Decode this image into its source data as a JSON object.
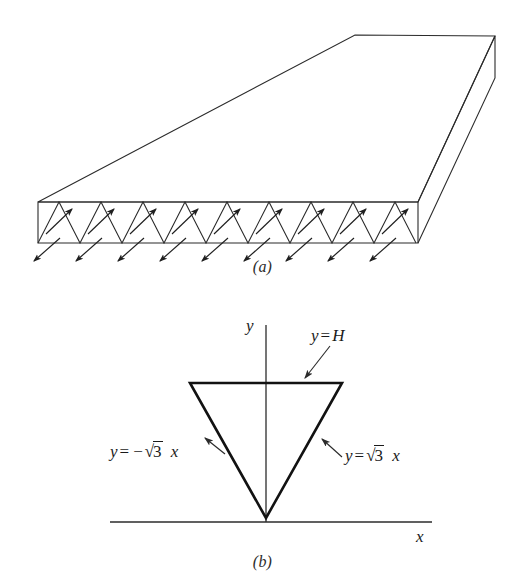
{
  "figure": {
    "panels": [
      {
        "id": "a",
        "caption": "(a)",
        "name": "three-dimensional-slab",
        "description": "prismatic slab with zigzag cross-hatched front face and flux arrows",
        "zigzag_peaks": 9,
        "inner_arrow_count": 9,
        "outer_arrow_count": 9,
        "inner_arrow_direction": "up-right",
        "outer_arrow_direction": "down-left"
      },
      {
        "id": "b",
        "caption": "(b)",
        "name": "cross-section-triangle",
        "description": "inverted equilateral triangle cross-section on x-y axes"
      }
    ]
  },
  "axes": {
    "y_label": "y",
    "x_label": "x"
  },
  "labels": {
    "top_edge": {
      "full": "y = H",
      "lhs": "y",
      "operator": "=",
      "rhs": "H"
    },
    "left_edge": {
      "full": "y = -√3 x",
      "lhs": "y",
      "operator": "=",
      "sign": "−",
      "radical": "√",
      "radicand": "3",
      "variable": "x"
    },
    "right_edge": {
      "full": "y = √3 x",
      "lhs": "y",
      "operator": "=",
      "radical": "√",
      "radicand": "3",
      "variable": "x"
    }
  },
  "colors": {
    "background": "#ffffff",
    "stroke": "#2b2b2b",
    "triangle_stroke": "#1a1a1a",
    "text": "#1a1a1a"
  },
  "geometry": {
    "triangle": {
      "apex": [
        266,
        226
      ],
      "top_left": [
        190,
        91
      ],
      "top_right": [
        342,
        91
      ]
    },
    "x_axis": {
      "y": 230,
      "x_start": 110,
      "x_end": 432
    },
    "y_axis": {
      "x": 266,
      "y_start": 33,
      "y_end": 230
    }
  }
}
